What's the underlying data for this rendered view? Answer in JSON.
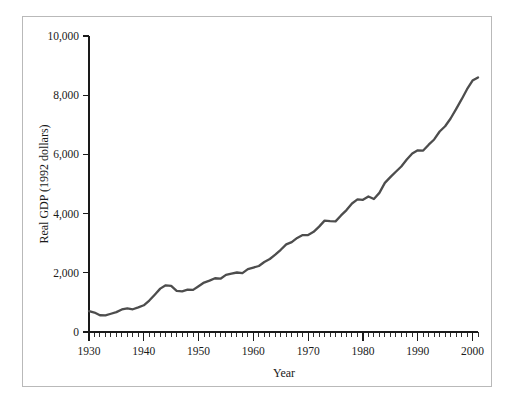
{
  "chart_data": {
    "type": "line",
    "title": "",
    "xlabel": "Year",
    "ylabel": "Real GDP (1992 dollars)",
    "xlim": [
      1930,
      2001
    ],
    "ylim": [
      0,
      10000
    ],
    "grid": false,
    "legend": null,
    "line_color": "#4d4d4d",
    "axis_color": "#1a1a1a",
    "frame_color": "#b9b9b9",
    "xticks": [
      1930,
      1940,
      1950,
      1960,
      1970,
      1980,
      1990,
      2000
    ],
    "xtick_labels": [
      "1930",
      "1940",
      "1950",
      "1960",
      "1970",
      "1980",
      "1990",
      "2000"
    ],
    "xtick_minor_step": 1,
    "yticks": [
      0,
      2000,
      4000,
      6000,
      8000,
      10000
    ],
    "ytick_labels": [
      "0",
      "2,000",
      "4,000",
      "6,000",
      "8,000",
      "10,000"
    ],
    "series_name": "Real GDP",
    "x": [
      1930,
      1931,
      1932,
      1933,
      1934,
      1935,
      1936,
      1937,
      1938,
      1939,
      1940,
      1941,
      1942,
      1943,
      1944,
      1945,
      1946,
      1947,
      1948,
      1949,
      1950,
      1951,
      1952,
      1953,
      1954,
      1955,
      1956,
      1957,
      1958,
      1959,
      1960,
      1961,
      1962,
      1963,
      1964,
      1965,
      1966,
      1967,
      1968,
      1969,
      1970,
      1971,
      1972,
      1973,
      1974,
      1975,
      1976,
      1977,
      1978,
      1979,
      1980,
      1981,
      1982,
      1983,
      1984,
      1985,
      1986,
      1987,
      1988,
      1989,
      1990,
      1991,
      1992,
      1993,
      1994,
      1995,
      1996,
      1997,
      1998,
      1999,
      2000,
      2001
    ],
    "values": [
      1000,
      930,
      800,
      790,
      870,
      950,
      1075,
      1130,
      1085,
      1175,
      1275,
      1500,
      1780,
      2070,
      2230,
      2200,
      1960,
      1940,
      2020,
      2010,
      2185,
      2360,
      2450,
      2565,
      2545,
      2725,
      2785,
      2840,
      2810,
      3000,
      3075,
      3150,
      3340,
      3485,
      3690,
      3925,
      4180,
      4290,
      4490,
      4625,
      4630,
      4780,
      5030,
      5315,
      5290,
      5280,
      5565,
      5820,
      6135,
      6330,
      6310,
      6470,
      6350,
      6640,
      7120,
      7390,
      7650,
      7900,
      8230,
      8520,
      8670,
      8660,
      8940,
      9190,
      9570,
      9820,
      10190,
      10640,
      11100,
      11590,
      12000,
      12150
    ],
    "values_display_note": "Plotted values scaled to axis 0-10,000; final point approx 8,600"
  },
  "plot_geometry": {
    "x_axis_px": {
      "x0": 89,
      "x1": 478,
      "y": 332
    },
    "y_axis_px": {
      "x": 89,
      "y0": 36,
      "y1": 332
    }
  }
}
